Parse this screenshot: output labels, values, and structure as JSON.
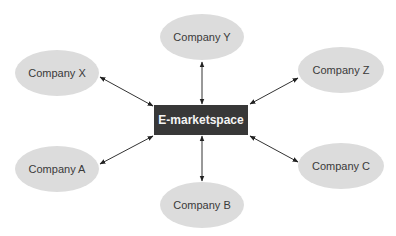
{
  "diagram": {
    "hub": {
      "label": "E-marketspace",
      "color": "#383838"
    },
    "nodes": [
      {
        "id": "x",
        "label": "Company X"
      },
      {
        "id": "y",
        "label": "Company Y"
      },
      {
        "id": "z",
        "label": "Company Z"
      },
      {
        "id": "a",
        "label": "Company A"
      },
      {
        "id": "b",
        "label": "Company B"
      },
      {
        "id": "c",
        "label": "Company C"
      }
    ],
    "edges": [
      {
        "from": "Company X",
        "to": "E-marketspace",
        "type": "bidirectional"
      },
      {
        "from": "Company Y",
        "to": "E-marketspace",
        "type": "bidirectional"
      },
      {
        "from": "Company Z",
        "to": "E-marketspace",
        "type": "bidirectional"
      },
      {
        "from": "Company A",
        "to": "E-marketspace",
        "type": "bidirectional"
      },
      {
        "from": "Company B",
        "to": "E-marketspace",
        "type": "bidirectional"
      },
      {
        "from": "Company C",
        "to": "E-marketspace",
        "type": "bidirectional"
      }
    ],
    "node_color": "#dcdcdc"
  }
}
